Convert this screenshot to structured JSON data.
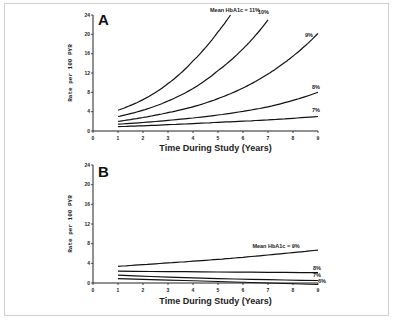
{
  "chart_data": [
    {
      "type": "line",
      "panel": "A",
      "title": "",
      "xlabel": "Time During Study (Years)",
      "ylabel": "Rate per 100 PYR",
      "xlim": [
        0,
        9
      ],
      "ylim": [
        0,
        24
      ],
      "xticks": [
        "0",
        "1",
        "2",
        "3",
        "4",
        "5",
        "6",
        "7",
        "8",
        "9"
      ],
      "yticks": [
        "0",
        "4",
        "8",
        "12",
        "16",
        "20",
        "24"
      ],
      "legend_title": "Mean HbA1c =",
      "series": [
        {
          "name": "11%",
          "x": [
            1,
            2,
            3,
            4,
            5,
            5.5
          ],
          "values": [
            4.3,
            6.5,
            9.8,
            14.5,
            20.5,
            24
          ]
        },
        {
          "name": "10%",
          "x": [
            1,
            2,
            3,
            4,
            5,
            6,
            7
          ],
          "values": [
            3.0,
            4.3,
            6.2,
            8.8,
            12.5,
            17,
            23
          ]
        },
        {
          "name": "9%",
          "x": [
            1,
            2,
            3,
            4,
            5,
            6,
            7,
            8,
            9
          ],
          "values": [
            2.0,
            2.8,
            3.8,
            5.0,
            6.7,
            8.9,
            11.8,
            15.5,
            20.2
          ]
        },
        {
          "name": "8%",
          "x": [
            1,
            3,
            5,
            7,
            9
          ],
          "values": [
            1.4,
            2.2,
            3.3,
            5.0,
            8.0
          ]
        },
        {
          "name": "7%",
          "x": [
            1,
            3,
            5,
            7,
            9
          ],
          "values": [
            0.9,
            1.3,
            1.8,
            2.3,
            3.0
          ]
        }
      ],
      "grid": false
    },
    {
      "type": "line",
      "panel": "B",
      "title": "",
      "xlabel": "Time During Study (Years)",
      "ylabel": "Rate per 100 PYR",
      "xlim": [
        0,
        9
      ],
      "ylim": [
        0,
        24
      ],
      "xticks": [
        "0",
        "1",
        "2",
        "3",
        "4",
        "5",
        "6",
        "7",
        "8",
        "9"
      ],
      "yticks": [
        "0",
        "4",
        "8",
        "12",
        "16",
        "20",
        "24"
      ],
      "legend_title": "Mean HbA1c =",
      "series": [
        {
          "name": "9%",
          "x": [
            1,
            3,
            5,
            7,
            9
          ],
          "values": [
            3.4,
            4.1,
            4.8,
            5.7,
            6.7
          ]
        },
        {
          "name": "8%",
          "x": [
            1,
            9
          ],
          "values": [
            2.4,
            2.1
          ]
        },
        {
          "name": "7%",
          "x": [
            1,
            9
          ],
          "values": [
            1.6,
            0.5
          ]
        },
        {
          "name": "6%",
          "x": [
            1,
            9
          ],
          "values": [
            0.9,
            -0.3
          ]
        }
      ],
      "grid": false
    }
  ],
  "panels": {
    "a": {
      "label": "A",
      "legend_prefix": "Mean HbA1c =",
      "labels": [
        "11%",
        "10%",
        "9%",
        "8%",
        "7%"
      ]
    },
    "b": {
      "label": "B",
      "legend_prefix": "Mean HbA1c =",
      "labels": [
        "9%",
        "8%",
        "7%",
        "6%"
      ]
    }
  },
  "axes": {
    "xlabel": "Time During Study (Years)",
    "ylabel": "Rate per 100 PYR"
  }
}
